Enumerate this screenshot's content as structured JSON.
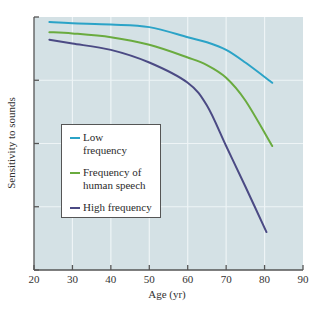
{
  "chart_data": {
    "type": "line",
    "title": "",
    "xlabel": "Age (yr)",
    "ylabel": "Sensitivity to sounds",
    "xlim": [
      20,
      90
    ],
    "ylim": [
      0,
      100
    ],
    "xticks": [
      20,
      30,
      40,
      50,
      60,
      70,
      80,
      90
    ],
    "yticks_unlabeled": [
      0,
      25,
      50,
      75,
      100
    ],
    "grid": true,
    "legend_position": "lower left (inside plot)",
    "series": [
      {
        "name": "Low frequency",
        "color": "#2ba3c7",
        "x": [
          24,
          30,
          40,
          50,
          60,
          65,
          70,
          75,
          82
        ],
        "y": [
          98,
          97.5,
          97,
          96,
          92,
          90,
          87,
          82,
          74
        ]
      },
      {
        "name": "Frequency of human speech",
        "color": "#6aab3f",
        "x": [
          24,
          30,
          40,
          50,
          60,
          65,
          70,
          75,
          82
        ],
        "y": [
          94,
          93.5,
          92,
          89,
          84,
          81,
          76,
          67,
          49
        ]
      },
      {
        "name": "High frequency",
        "color": "#4b4a84",
        "x": [
          24,
          30,
          40,
          50,
          60,
          65,
          70,
          75,
          80.5
        ],
        "y": [
          91,
          89.5,
          87,
          82,
          74,
          65,
          49,
          33,
          15
        ]
      }
    ]
  },
  "legend": {
    "items": [
      {
        "label": "Low\nfrequency",
        "color": "#2ba3c7"
      },
      {
        "label": "Frequency of\nhuman speech",
        "color": "#6aab3f"
      },
      {
        "label": "High frequency",
        "color": "#4b4a84"
      }
    ]
  },
  "axes": {
    "xlabel": "Age (yr)",
    "ylabel": "Sensitivity to sounds"
  },
  "colors": {
    "plot_background": "#d4e1e5",
    "grid": "#eef4f6",
    "axis": "#555555"
  }
}
